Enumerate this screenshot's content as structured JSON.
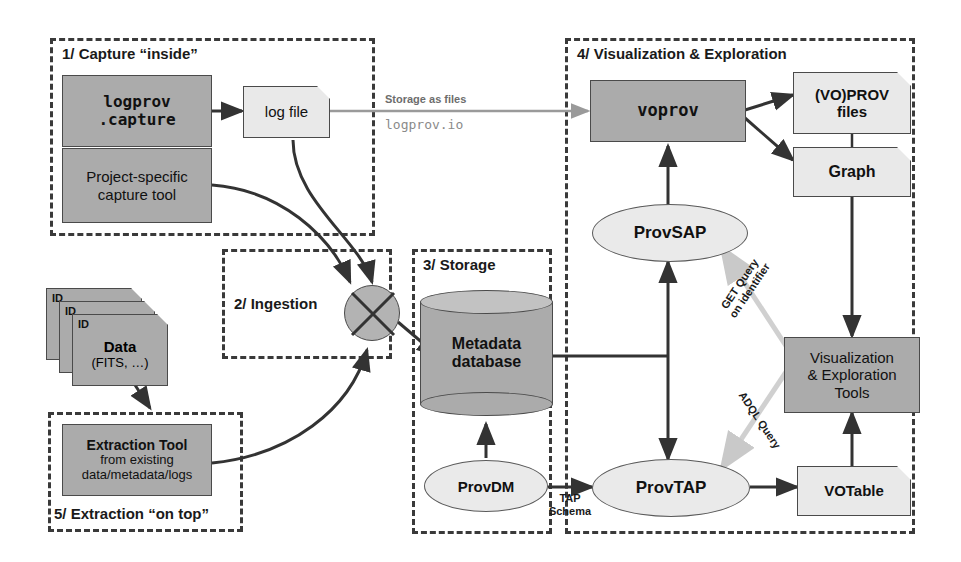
{
  "diagram": {
    "colors": {
      "dark_fill": "#ababab",
      "light_fill": "#e9e9e9",
      "ellipse_fill": "#eaeaea",
      "frame_stroke": "#3a3a3a",
      "arrow_dark": "#333333",
      "arrow_grey": "#999999",
      "background": "#ffffff"
    },
    "groups": [
      {
        "id": "capture",
        "label": "1/ Capture “inside”"
      },
      {
        "id": "ingestion",
        "label": "2/ Ingestion"
      },
      {
        "id": "storage",
        "label": "3/ Storage"
      },
      {
        "id": "visualization",
        "label": "4/ Visualization & Exploration"
      },
      {
        "id": "extraction",
        "label": "5/ Extraction “on top”"
      }
    ],
    "nodes": {
      "logprov_capture": {
        "line1": "logprov",
        "line2": ".capture"
      },
      "project_capture": {
        "line1": "Project-specific",
        "line2": "capture tool"
      },
      "log_file": {
        "label": "log file"
      },
      "data_stack": {
        "id_tag": "ID",
        "line1": "Data",
        "line2": "(FITS, …)"
      },
      "extraction_tool": {
        "line1": "Extraction Tool",
        "line2": "from existing",
        "line3": "data/metadata/logs"
      },
      "metadata_database": {
        "line1": "Metadata",
        "line2": "database"
      },
      "provdm": {
        "label": "ProvDM"
      },
      "provtap": {
        "label": "ProvTAP"
      },
      "provsap": {
        "label": "ProvSAP"
      },
      "voprov": {
        "label": "voprov"
      },
      "voprov_files": {
        "line1": "(VO)PROV",
        "line2": "files"
      },
      "graph": {
        "label": "Graph"
      },
      "vis_tools": {
        "line1": "Visualization",
        "line2": "& Exploration",
        "line3": "Tools"
      },
      "votable": {
        "label": "VOTable"
      }
    },
    "edge_labels": {
      "storage_as_files": "Storage as files",
      "logprov_io": "logprov.io",
      "tap_schema_line1": "TAP",
      "tap_schema_line2": "Schema",
      "get_query_line1": "GET Query",
      "get_query_line2": "on identifier",
      "adql_query": "ADQL Query"
    }
  }
}
